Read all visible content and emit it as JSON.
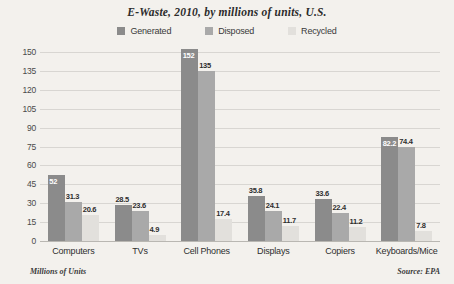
{
  "chart_data": {
    "type": "bar",
    "title": "E-Waste, 2010, by millions of units, U.S.",
    "xlabel": "",
    "ylabel": "Millions of Units",
    "ylim": [
      0,
      150
    ],
    "yticks": [
      0,
      15,
      30,
      45,
      60,
      75,
      90,
      105,
      120,
      135,
      150
    ],
    "grid": true,
    "legend_position": "top-center",
    "categories": [
      "Computers",
      "TVs",
      "Cell Phones",
      "Displays",
      "Copiers",
      "Keyboards/Mice"
    ],
    "series": [
      {
        "name": "Generated",
        "color": "#8b8b8b",
        "values": [
          52,
          28.5,
          152,
          35.8,
          33.6,
          82.2
        ]
      },
      {
        "name": "Disposed",
        "color": "#a9a9a9",
        "values": [
          31.3,
          23.6,
          135,
          24.1,
          22.4,
          74.4
        ]
      },
      {
        "name": "Recycled",
        "color": "#e2e0dc",
        "values": [
          20.6,
          4.9,
          17.4,
          11.7,
          11.2,
          7.8
        ]
      }
    ],
    "value_labels": [
      [
        "52",
        "31.3",
        "20.6"
      ],
      [
        "28.5",
        "23.6",
        "4.9"
      ],
      [
        "152",
        "135",
        "17.4"
      ],
      [
        "35.8",
        "24.1",
        "11.7"
      ],
      [
        "33.6",
        "22.4",
        "11.2"
      ],
      [
        "82.2",
        "74.4",
        "7.8"
      ]
    ],
    "source": "Source: EPA"
  },
  "footer": {
    "units_note": "Millions of Units",
    "source_note": "Source: EPA"
  }
}
